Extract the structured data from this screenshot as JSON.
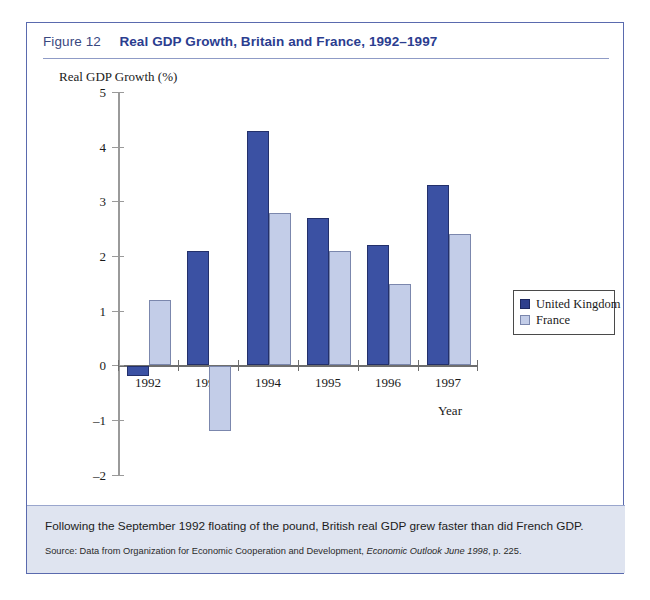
{
  "figure": {
    "label": "Figure 12",
    "title": "Real GDP Growth, Britain and France, 1992–1997"
  },
  "caption": {
    "text": "Following the September 1992 floating of the pound, British real GDP grew faster than did French GDP.",
    "source_prefix": "Source: Data from Organization for Economic Cooperation and Development, ",
    "source_italic": "Economic Outlook June 1998",
    "source_suffix": ", p. 225."
  },
  "colors": {
    "uk_bar": "#3b51a3",
    "france_bar": "#c3cde8",
    "frame_border": "#5a6aae",
    "title_blue": "#2b3d8f",
    "caption_background": "#dfe4f0"
  },
  "chart_data": {
    "type": "bar",
    "title": "Real GDP Growth, Britain and France, 1992–1997",
    "xlabel": "Year",
    "ylabel": "Real GDP Growth (%)",
    "categories": [
      "1992",
      "1993",
      "1994",
      "1995",
      "1996",
      "1997"
    ],
    "series": [
      {
        "name": "United Kingdom",
        "color": "#3b51a3",
        "values": [
          -0.2,
          2.1,
          4.3,
          2.7,
          2.2,
          3.3
        ]
      },
      {
        "name": "France",
        "color": "#c3cde8",
        "values": [
          1.2,
          -1.2,
          2.8,
          2.1,
          1.5,
          2.4
        ]
      }
    ],
    "ylim": [
      -2,
      5
    ],
    "yticks": [
      5,
      4,
      3,
      2,
      1,
      0,
      -1,
      -2
    ],
    "ytick_labels": [
      "5",
      "4",
      "3",
      "2",
      "1",
      "0",
      "–1",
      "–2"
    ],
    "grid": false,
    "legend_position": "right"
  }
}
